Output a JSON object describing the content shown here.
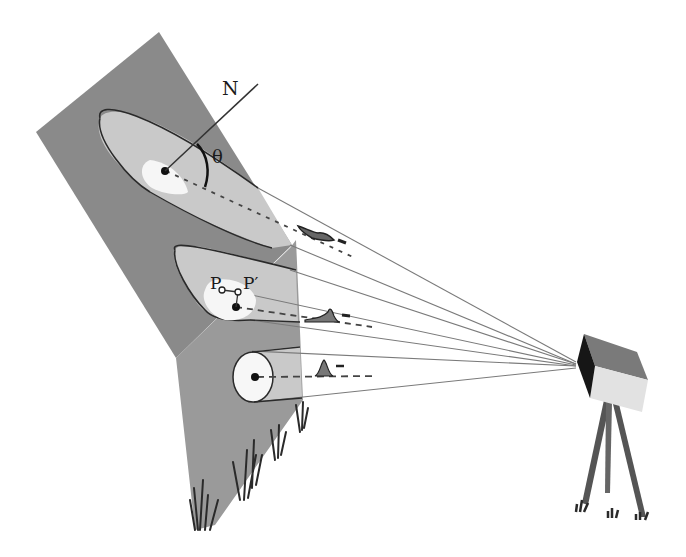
{
  "diagram": {
    "labels": {
      "normal": "N",
      "angle": "θ",
      "point_p": "P",
      "point_p_prime": "P′"
    },
    "colors": {
      "background": "#ffffff",
      "upper_panel": "#8c8c8c",
      "lower_panel": "#999999",
      "beam_light": "#cfcfcf",
      "footprint_white": "#f7f7f7",
      "outline": "#2a2a2a",
      "ray_line": "#777777",
      "camera_top": "#7a7a7a",
      "camera_front": "#e4e4e4",
      "camera_lens": "#151515",
      "tripod": "#555555",
      "grass": "#2c2c2c"
    },
    "beams": [
      {
        "name": "oblique-top",
        "footprint": "elongated ellipse",
        "pulse": "spread"
      },
      {
        "name": "middle-fold",
        "footprint": "straddles fold",
        "pulse": "broadened"
      },
      {
        "name": "nadir-bottom",
        "footprint": "circle",
        "pulse": "narrow"
      }
    ]
  }
}
